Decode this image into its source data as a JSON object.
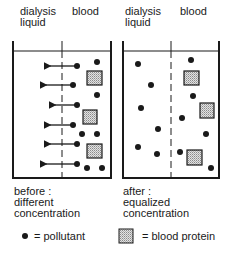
{
  "panels": [
    {
      "id": "before",
      "header": {
        "left": "dialysis\nliquid",
        "left_line1": "dialysis",
        "left_line2": "liquid",
        "right": "blood"
      },
      "caption": {
        "line1": "before :",
        "line2": "different",
        "line3": "concentration"
      },
      "container": {
        "x1": 13,
        "x2": 111,
        "top": 41,
        "water": 51,
        "bottom": 178,
        "divider_x": 62
      },
      "arrows": [
        {
          "y": 66,
          "from_x": 77,
          "to_x": 45
        },
        {
          "y": 85,
          "from_x": 73,
          "to_x": 41
        },
        {
          "y": 105,
          "from_x": 77,
          "to_x": 50
        },
        {
          "y": 125,
          "from_x": 73,
          "to_x": 45
        },
        {
          "y": 144,
          "from_x": 77,
          "to_x": 45
        },
        {
          "y": 164,
          "from_x": 77,
          "to_x": 41
        }
      ],
      "pollutants": [
        [
          77,
          66
        ],
        [
          97,
          62
        ],
        [
          73,
          85
        ],
        [
          97,
          95
        ],
        [
          77,
          105
        ],
        [
          73,
          125
        ],
        [
          82,
          134
        ],
        [
          97,
          134
        ],
        [
          77,
          144
        ],
        [
          77,
          164
        ],
        [
          87,
          168
        ],
        [
          102,
          168
        ]
      ],
      "proteins": [
        {
          "x": 87,
          "y": 71,
          "w": 15,
          "h": 14
        },
        {
          "x": 83,
          "y": 110,
          "w": 14,
          "h": 14
        },
        {
          "x": 87,
          "y": 144,
          "w": 15,
          "h": 14
        }
      ]
    },
    {
      "id": "after",
      "header": {
        "left_line1": "dialysis",
        "left_line2": "liquid",
        "right": "blood"
      },
      "caption": {
        "line1": "after :",
        "line2": "equalized",
        "line3": "concentration"
      },
      "container": {
        "x1": 123,
        "x2": 219,
        "top": 41,
        "water": 51,
        "bottom": 178,
        "divider_x": 171
      },
      "arrows": [],
      "pollutants": [
        [
          138,
          64
        ],
        [
          191,
          60
        ],
        [
          151,
          85
        ],
        [
          193,
          96
        ],
        [
          141,
          108
        ],
        [
          182,
          118
        ],
        [
          158,
          129
        ],
        [
          206,
          134
        ],
        [
          138,
          147
        ],
        [
          157,
          154
        ],
        [
          180,
          152
        ],
        [
          211,
          168
        ]
      ],
      "proteins": [
        {
          "x": 184,
          "y": 71,
          "w": 15,
          "h": 14
        },
        {
          "x": 200,
          "y": 103,
          "w": 14,
          "h": 15
        },
        {
          "x": 187,
          "y": 150,
          "w": 15,
          "h": 15
        }
      ]
    }
  ],
  "legend": {
    "pollutant_label": "= pollutant",
    "protein_label": "= blood protein"
  },
  "colors": {
    "ink": "#1a1a1a",
    "protein_fill": "#c8c8c8",
    "background": "#ffffff"
  }
}
